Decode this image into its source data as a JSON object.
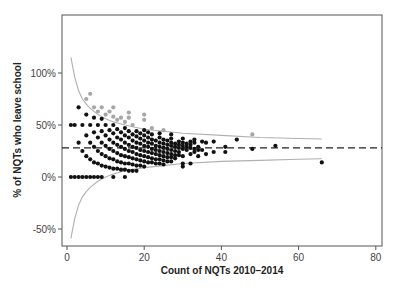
{
  "chart_data": {
    "type": "scatter",
    "title": "",
    "xlabel": "Count of NQTs 2010–2014",
    "ylabel": "% of NQTs who leave school",
    "xlim": [
      -1,
      82
    ],
    "ylim": [
      -65,
      158
    ],
    "x_ticks": [
      0,
      20,
      40,
      60,
      80
    ],
    "x_tick_labels": [
      "0",
      "20",
      "40",
      "60",
      "80"
    ],
    "y_ticks": [
      -50,
      0,
      50,
      100
    ],
    "y_tick_labels": [
      "-50%",
      "0%",
      "50%",
      "100%"
    ],
    "grid": false,
    "legend": null,
    "mean_line": {
      "y": 28,
      "style": "dashed",
      "color": "#222222"
    },
    "funnel_limits": {
      "color": "#b0b0b0",
      "upper": [
        [
          1,
          115
        ],
        [
          2,
          96
        ],
        [
          3,
          83
        ],
        [
          4,
          75
        ],
        [
          5,
          70
        ],
        [
          6,
          66
        ],
        [
          8,
          60
        ],
        [
          10,
          56
        ],
        [
          12,
          53
        ],
        [
          15,
          50
        ],
        [
          20,
          46
        ],
        [
          25,
          44
        ],
        [
          30,
          42
        ],
        [
          40,
          40
        ],
        [
          50,
          38
        ],
        [
          60,
          37
        ],
        [
          66,
          36.5
        ]
      ],
      "lower": [
        [
          1,
          -59
        ],
        [
          2,
          -40
        ],
        [
          3,
          -27
        ],
        [
          4,
          -19
        ],
        [
          5,
          -14
        ],
        [
          6,
          -10
        ],
        [
          8,
          -4
        ],
        [
          10,
          0
        ],
        [
          12,
          3
        ],
        [
          15,
          6
        ],
        [
          20,
          9
        ],
        [
          25,
          11
        ],
        [
          30,
          13
        ],
        [
          40,
          15
        ],
        [
          50,
          16
        ],
        [
          60,
          17
        ],
        [
          66,
          17.5
        ]
      ]
    },
    "series": [
      {
        "name": "above upper limit",
        "color": "#a6a6a6",
        "points": [
          [
            5,
            75
          ],
          [
            6,
            80
          ],
          [
            7,
            67
          ],
          [
            8,
            63
          ],
          [
            9,
            67
          ],
          [
            10,
            60
          ],
          [
            11,
            63
          ],
          [
            12,
            67
          ],
          [
            12,
            58
          ],
          [
            13,
            55
          ],
          [
            14,
            57
          ],
          [
            15,
            53
          ],
          [
            16,
            62
          ],
          [
            16,
            57
          ],
          [
            17,
            50
          ],
          [
            20,
            60
          ],
          [
            20,
            55
          ],
          [
            22,
            47
          ],
          [
            25,
            45
          ],
          [
            48,
            41
          ]
        ]
      },
      {
        "name": "within / below limits",
        "color": "#111111",
        "points": [
          [
            1,
            0
          ],
          [
            2,
            0
          ],
          [
            3,
            0
          ],
          [
            4,
            0
          ],
          [
            5,
            0
          ],
          [
            6,
            0
          ],
          [
            7,
            0
          ],
          [
            8,
            0
          ],
          [
            9,
            0
          ],
          [
            12,
            0
          ],
          [
            15,
            0
          ],
          [
            1,
            50
          ],
          [
            2,
            50
          ],
          [
            3,
            33
          ],
          [
            3,
            67
          ],
          [
            4,
            25
          ],
          [
            4,
            50
          ],
          [
            5,
            20
          ],
          [
            5,
            40
          ],
          [
            5,
            60
          ],
          [
            6,
            17
          ],
          [
            6,
            33
          ],
          [
            6,
            50
          ],
          [
            7,
            14
          ],
          [
            7,
            29
          ],
          [
            7,
            43
          ],
          [
            7,
            57
          ],
          [
            8,
            13
          ],
          [
            8,
            25
          ],
          [
            8,
            38
          ],
          [
            8,
            50
          ],
          [
            9,
            11
          ],
          [
            9,
            22
          ],
          [
            9,
            33
          ],
          [
            9,
            44
          ],
          [
            9,
            56
          ],
          [
            10,
            10
          ],
          [
            10,
            20
          ],
          [
            10,
            30
          ],
          [
            10,
            40
          ],
          [
            10,
            50
          ],
          [
            11,
            9
          ],
          [
            11,
            18
          ],
          [
            11,
            27
          ],
          [
            11,
            36
          ],
          [
            11,
            45
          ],
          [
            12,
            8
          ],
          [
            12,
            17
          ],
          [
            12,
            25
          ],
          [
            12,
            33
          ],
          [
            12,
            42
          ],
          [
            12,
            50
          ],
          [
            13,
            8
          ],
          [
            13,
            15
          ],
          [
            13,
            23
          ],
          [
            13,
            31
          ],
          [
            13,
            38
          ],
          [
            13,
            46
          ],
          [
            14,
            7
          ],
          [
            14,
            14
          ],
          [
            14,
            21
          ],
          [
            14,
            29
          ],
          [
            14,
            36
          ],
          [
            14,
            43
          ],
          [
            15,
            7
          ],
          [
            15,
            13
          ],
          [
            15,
            20
          ],
          [
            15,
            27
          ],
          [
            15,
            33
          ],
          [
            15,
            40
          ],
          [
            15,
            47
          ],
          [
            16,
            6
          ],
          [
            16,
            13
          ],
          [
            16,
            19
          ],
          [
            16,
            25
          ],
          [
            16,
            31
          ],
          [
            16,
            38
          ],
          [
            16,
            44
          ],
          [
            17,
            6
          ],
          [
            17,
            12
          ],
          [
            17,
            18
          ],
          [
            17,
            24
          ],
          [
            17,
            29
          ],
          [
            17,
            35
          ],
          [
            17,
            41
          ],
          [
            18,
            6
          ],
          [
            18,
            11
          ],
          [
            18,
            17
          ],
          [
            18,
            22
          ],
          [
            18,
            28
          ],
          [
            18,
            33
          ],
          [
            18,
            39
          ],
          [
            18,
            44
          ],
          [
            19,
            11
          ],
          [
            19,
            16
          ],
          [
            19,
            21
          ],
          [
            19,
            26
          ],
          [
            19,
            32
          ],
          [
            19,
            37
          ],
          [
            19,
            42
          ],
          [
            20,
            10
          ],
          [
            20,
            15
          ],
          [
            20,
            20
          ],
          [
            20,
            25
          ],
          [
            20,
            30
          ],
          [
            20,
            35
          ],
          [
            20,
            40
          ],
          [
            20,
            45
          ],
          [
            21,
            14
          ],
          [
            21,
            19
          ],
          [
            21,
            24
          ],
          [
            21,
            29
          ],
          [
            21,
            33
          ],
          [
            21,
            38
          ],
          [
            21,
            43
          ],
          [
            22,
            14
          ],
          [
            22,
            18
          ],
          [
            22,
            23
          ],
          [
            22,
            27
          ],
          [
            22,
            32
          ],
          [
            22,
            36
          ],
          [
            22,
            41
          ],
          [
            23,
            13
          ],
          [
            23,
            17
          ],
          [
            23,
            22
          ],
          [
            23,
            26
          ],
          [
            23,
            30
          ],
          [
            23,
            35
          ],
          [
            24,
            13
          ],
          [
            24,
            17
          ],
          [
            24,
            21
          ],
          [
            24,
            25
          ],
          [
            24,
            29
          ],
          [
            24,
            33
          ],
          [
            24,
            38
          ],
          [
            24,
            42
          ],
          [
            25,
            12
          ],
          [
            25,
            16
          ],
          [
            25,
            20
          ],
          [
            25,
            24
          ],
          [
            25,
            28
          ],
          [
            25,
            32
          ],
          [
            25,
            36
          ],
          [
            26,
            15
          ],
          [
            26,
            19
          ],
          [
            26,
            23
          ],
          [
            26,
            27
          ],
          [
            26,
            31
          ],
          [
            26,
            35
          ],
          [
            27,
            15
          ],
          [
            27,
            19
          ],
          [
            27,
            22
          ],
          [
            27,
            26
          ],
          [
            27,
            30
          ],
          [
            27,
            33
          ],
          [
            27,
            37
          ],
          [
            27,
            41
          ],
          [
            28,
            18
          ],
          [
            28,
            21
          ],
          [
            28,
            25
          ],
          [
            28,
            29
          ],
          [
            28,
            32
          ],
          [
            29,
            21
          ],
          [
            29,
            24
          ],
          [
            29,
            28
          ],
          [
            29,
            31
          ],
          [
            29,
            34
          ],
          [
            30,
            10
          ],
          [
            30,
            13
          ],
          [
            30,
            20
          ],
          [
            30,
            27
          ],
          [
            30,
            30
          ],
          [
            30,
            33
          ],
          [
            30,
            37
          ],
          [
            31,
            26
          ],
          [
            31,
            29
          ],
          [
            31,
            32
          ],
          [
            32,
            13
          ],
          [
            32,
            22
          ],
          [
            32,
            28
          ],
          [
            32,
            31
          ],
          [
            32,
            34
          ],
          [
            33,
            24
          ],
          [
            33,
            27
          ],
          [
            33,
            33
          ],
          [
            33,
            36
          ],
          [
            34,
            20
          ],
          [
            34,
            26
          ],
          [
            34,
            29
          ],
          [
            35,
            26
          ],
          [
            35,
            34
          ],
          [
            36,
            22
          ],
          [
            36,
            33
          ],
          [
            38,
            24
          ],
          [
            38,
            34
          ],
          [
            41,
            24
          ],
          [
            41,
            29
          ],
          [
            44,
            36
          ],
          [
            48,
            27
          ],
          [
            54,
            30
          ],
          [
            66,
            14
          ]
        ]
      }
    ]
  }
}
